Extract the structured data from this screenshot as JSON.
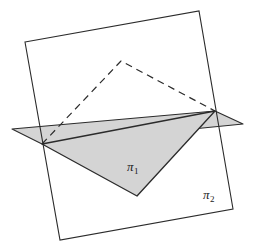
{
  "figure": {
    "background_color": "#ffffff",
    "width": 257,
    "height": 250,
    "labels": {
      "pi1": {
        "glyph": "π",
        "subscript": "1",
        "x": 127,
        "y": 160
      },
      "pi2": {
        "glyph": "π",
        "subscript": "2",
        "x": 203,
        "y": 188
      }
    },
    "colors": {
      "stroke": "#2b2b2b",
      "shaded_fill": "#d4d4d4",
      "dashed_stroke": "#2b2b2b",
      "page_background": "#ffffff"
    },
    "shapes": {
      "rectangle_pi2": {
        "name": "vertical-plane-rectangle",
        "points": "25,42 199,11 233,209 60,240",
        "fill": "none",
        "stroke_width": 1.1
      },
      "plane_pi1_quad": {
        "name": "horizontal-plane-quadrilateral",
        "points": "12,129 215,111 243,124 42,144",
        "fill": "#d4d4d4",
        "stroke_width": 1.1
      },
      "shaded_triangle": {
        "name": "shaded-solid-triangle",
        "points": "42,144 215,111 137,196",
        "fill": "#d4d4d4",
        "stroke_width": 1.3
      },
      "dashed_triangle": {
        "name": "hidden-dashed-triangle",
        "points": "42,144 121,61 215,111",
        "dash_pattern": "7,5",
        "stroke_width": 1.2
      }
    },
    "vertices": {
      "rect_top_left": [
        25,
        42
      ],
      "rect_top_right": [
        199,
        11
      ],
      "rect_bottom_right": [
        233,
        209
      ],
      "rect_bottom_left": [
        60,
        240
      ],
      "plane_left_tip": [
        12,
        129
      ],
      "plane_right_tip": [
        243,
        124
      ],
      "junction_left": [
        42,
        144
      ],
      "junction_right": [
        215,
        111
      ],
      "triangle_bottom": [
        137,
        196
      ],
      "dashed_apex": [
        121,
        61
      ]
    }
  }
}
